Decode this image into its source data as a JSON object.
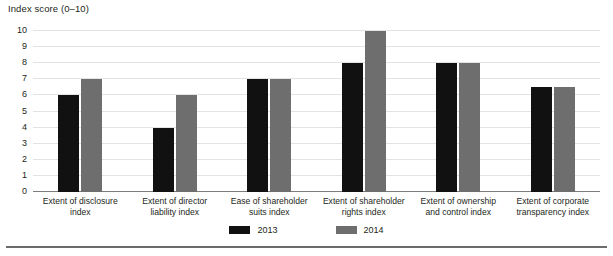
{
  "axis_title": "Index score (0–10)",
  "legend": {
    "items": [
      {
        "label": "2013",
        "color": "#111111"
      },
      {
        "label": "2014",
        "color": "#6e6e6e"
      }
    ]
  },
  "chart_data": {
    "type": "bar",
    "title": "Index score (0–10)",
    "xlabel": "",
    "ylabel": "Index score (0–10)",
    "ylim": [
      0,
      10
    ],
    "yticks": [
      0,
      1,
      2,
      3,
      4,
      5,
      6,
      7,
      8,
      9,
      10
    ],
    "ytick_labels": [
      "0",
      "1",
      "2",
      "3",
      "4",
      "5",
      "6",
      "7",
      "8",
      "9",
      "10"
    ],
    "grid": true,
    "legend_position": "bottom-center",
    "categories": [
      "Extent of disclosure index",
      "Extent of director liability index",
      "Ease of shareholder suits index",
      "Extent of shareholder rights index",
      "Extent of ownership and control index",
      "Extent of corporate transparency index"
    ],
    "category_lines": [
      [
        "Extent of disclosure",
        "index"
      ],
      [
        "Extent of director",
        "liability index"
      ],
      [
        "Ease of shareholder",
        "suits index"
      ],
      [
        "Extent of shareholder",
        "rights index"
      ],
      [
        "Extent of ownership",
        "and control index"
      ],
      [
        "Extent of corporate",
        "transparency index"
      ]
    ],
    "series": [
      {
        "name": "2013",
        "color": "#111111",
        "values": [
          6,
          4,
          7,
          8,
          8,
          6.5
        ]
      },
      {
        "name": "2014",
        "color": "#6e6e6e",
        "values": [
          7,
          6,
          7,
          10,
          8,
          6.5
        ]
      }
    ]
  }
}
